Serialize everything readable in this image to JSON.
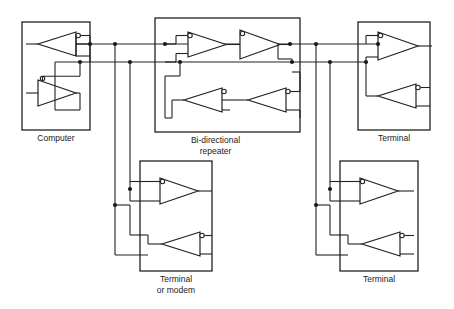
{
  "diagram": {
    "type": "schematic",
    "canvas": {
      "width": 454,
      "height": 309
    },
    "colors": {
      "line": "#222222",
      "background": "#ffffff",
      "text": "#1a1a1a",
      "gate_fill": "#ffffff"
    },
    "bus": {
      "description": "two-wire bi-directional bus",
      "lines": [
        {
          "name": "bus-line-upper",
          "y": 44
        },
        {
          "name": "bus-line-lower",
          "y": 62
        }
      ]
    },
    "blocks": [
      {
        "id": "computer",
        "label": "Computer",
        "label_line_2": "",
        "x": 22,
        "y": 22,
        "w": 68,
        "h": 108,
        "gates": [
          {
            "name": "receiver",
            "dir": "left",
            "bubble": "output-right"
          },
          {
            "name": "driver",
            "dir": "right",
            "bubble": "output-top"
          }
        ]
      },
      {
        "id": "repeater",
        "label": "Bi-directional",
        "label_line_2": "repeater",
        "x": 155,
        "y": 18,
        "w": 145,
        "h": 114,
        "gates": [
          {
            "name": "forward-driver-1",
            "dir": "right",
            "bubble": "input-top-left"
          },
          {
            "name": "forward-driver-2",
            "dir": "right",
            "bubble": "input-top-left"
          },
          {
            "name": "reverse-driver-1",
            "dir": "left",
            "bubble": "input-top-right"
          },
          {
            "name": "reverse-driver-2",
            "dir": "left",
            "bubble": "input-top-right"
          }
        ]
      },
      {
        "id": "terminal-top-right",
        "label": "Terminal",
        "label_line_2": "",
        "x": 358,
        "y": 22,
        "w": 72,
        "h": 108,
        "gates": [
          {
            "name": "receiver",
            "dir": "right",
            "bubble": "input-top-left"
          },
          {
            "name": "driver",
            "dir": "left",
            "bubble": "input-top-right"
          }
        ]
      },
      {
        "id": "terminal-or-modem",
        "label": "Terminal",
        "label_line_2": "or modem",
        "x": 140,
        "y": 161,
        "w": 72,
        "h": 110,
        "gates": [
          {
            "name": "receiver",
            "dir": "right",
            "bubble": "input-top-left"
          },
          {
            "name": "driver",
            "dir": "left",
            "bubble": "input-top-right"
          }
        ]
      },
      {
        "id": "terminal-bottom-right",
        "label": "Terminal",
        "label_line_2": "",
        "x": 340,
        "y": 161,
        "w": 78,
        "h": 110,
        "gates": [
          {
            "name": "receiver",
            "dir": "right",
            "bubble": "input-top-left"
          },
          {
            "name": "driver",
            "dir": "left",
            "bubble": "input-top-right"
          }
        ]
      }
    ],
    "junction_dots": [
      {
        "x": 76,
        "y": 44
      },
      {
        "x": 90,
        "y": 62
      },
      {
        "x": 115,
        "y": 44
      },
      {
        "x": 130,
        "y": 62
      },
      {
        "x": 165,
        "y": 44
      },
      {
        "x": 180,
        "y": 62
      },
      {
        "x": 278,
        "y": 44
      },
      {
        "x": 292,
        "y": 62
      },
      {
        "x": 316,
        "y": 44
      },
      {
        "x": 330,
        "y": 62
      },
      {
        "x": 378,
        "y": 44
      },
      {
        "x": 366,
        "y": 62
      },
      {
        "x": 130,
        "y": 189
      },
      {
        "x": 115,
        "y": 205
      },
      {
        "x": 330,
        "y": 189
      },
      {
        "x": 316,
        "y": 205
      }
    ]
  }
}
